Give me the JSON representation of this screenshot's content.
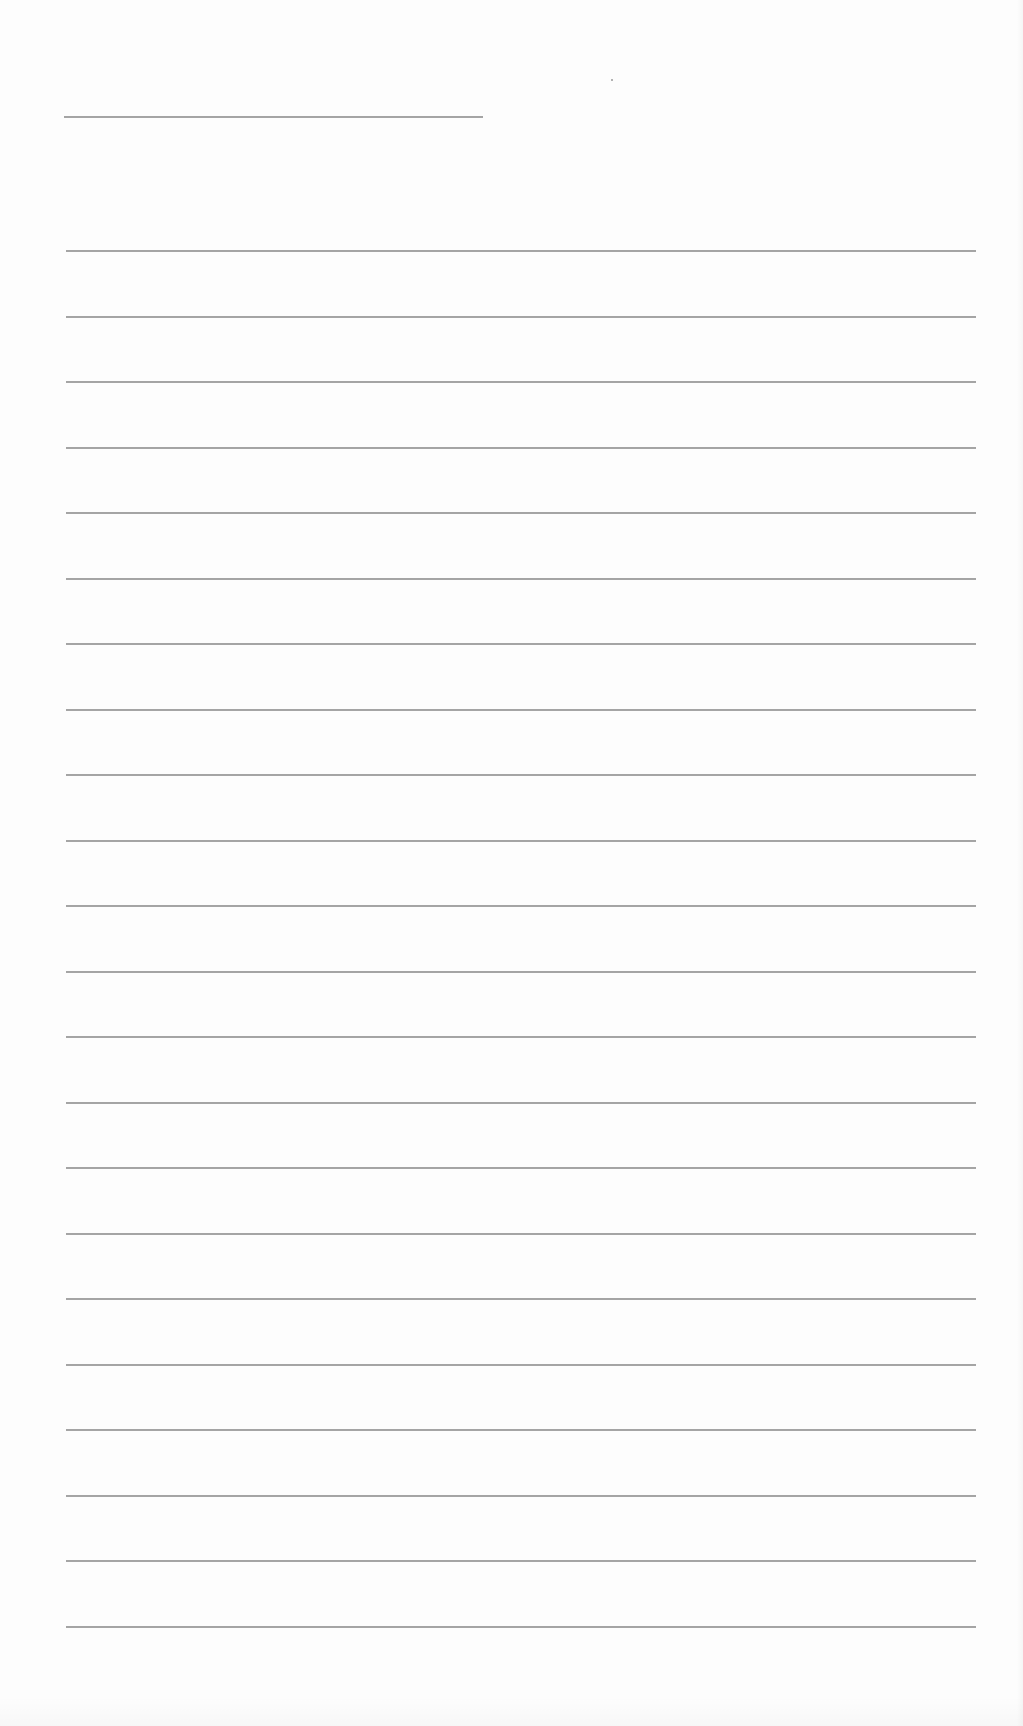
{
  "document": {
    "type": "lined-paper",
    "background_color": "#fdfdfd",
    "rule_color": "#a4a4a4",
    "header_rule": {
      "x": 64,
      "y": 116,
      "width": 419
    },
    "body_rules": {
      "count": 22,
      "x": 66,
      "width": 910,
      "first_y": 250,
      "spacing": 65.5
    },
    "text_content": []
  }
}
